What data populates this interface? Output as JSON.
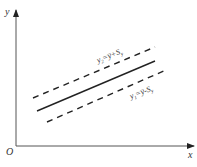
{
  "axes": {
    "y_label": "y",
    "x_label": "x",
    "origin_label": "O"
  },
  "lines": {
    "upper": {
      "style": "dashed",
      "label_main": "y",
      "label_sub": "2",
      "label_rest": "=y̅+S",
      "label_rest_sub": "y"
    },
    "center": {
      "style": "solid"
    },
    "lower": {
      "style": "dashed",
      "label_main": "y",
      "label_sub": "1",
      "label_rest": "=y̅-S",
      "label_rest_sub": "y"
    }
  },
  "colors": {
    "stroke": "#222222",
    "text": "#333333"
  }
}
